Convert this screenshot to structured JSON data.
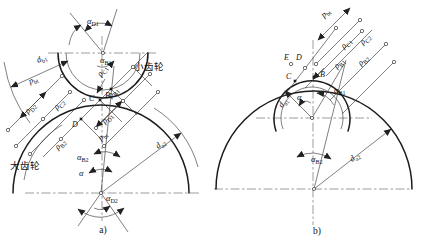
{
  "figure": {
    "caption_a": "a)",
    "caption_b": "b)",
    "pinion_label": "小齿轮",
    "gear_label": "大齿轮"
  },
  "colors": {
    "line": "#1c1c1c",
    "background": "#ffffff"
  },
  "a": {
    "alpha_D1": {
      "base": "α",
      "sub": "D1"
    },
    "alpha_B1": {
      "base": "α",
      "sub": "B1"
    },
    "alpha_B2": {
      "base": "α",
      "sub": "B2"
    },
    "alpha": {
      "base": "α",
      "sub": ""
    },
    "alpha_D2": {
      "base": "α",
      "sub": "D2"
    },
    "d_b1": {
      "base": "d",
      "sub": "b1"
    },
    "d_a2": {
      "base": "d",
      "sub": "a2"
    },
    "p_bt_left": {
      "base": "p",
      "sub": "bt"
    },
    "p_bt_mid": {
      "base": "p",
      "sub": "bt"
    },
    "rho_C1": {
      "base": "ρ",
      "sub": "C1"
    },
    "rho_C2": {
      "base": "ρ",
      "sub": "C2"
    },
    "rho_B1": {
      "base": "ρ",
      "sub": "B1"
    },
    "rho_B2": {
      "base": "ρ",
      "sub": "B2"
    },
    "rho_D1": {
      "base": "ρ",
      "sub": "D1"
    },
    "rho_D2": {
      "base": "ρ",
      "sub": "D2"
    },
    "point_B": "B",
    "point_C": "C",
    "point_D": "D"
  },
  "b": {
    "p_bt": {
      "base": "p",
      "sub": "bt"
    },
    "rho_C1": {
      "base": "ρ",
      "sub": "C1"
    },
    "rho_C2": {
      "base": "ρ",
      "sub": "C2"
    },
    "rho_B1": {
      "base": "ρ",
      "sub": "B1"
    },
    "rho_B2": {
      "base": "ρ",
      "sub": "B2"
    },
    "alpha_B1": {
      "base": "α",
      "sub": "B1"
    },
    "alpha_B2": {
      "base": "α",
      "sub": "B2"
    },
    "alpha": {
      "base": "α",
      "sub": ""
    },
    "d_a1": {
      "base": "d",
      "sub": "a1"
    },
    "d_a2": {
      "base": "d",
      "sub": "a2"
    },
    "point_E": "E",
    "point_D": "D",
    "point_C": "C",
    "point_B": "B"
  }
}
